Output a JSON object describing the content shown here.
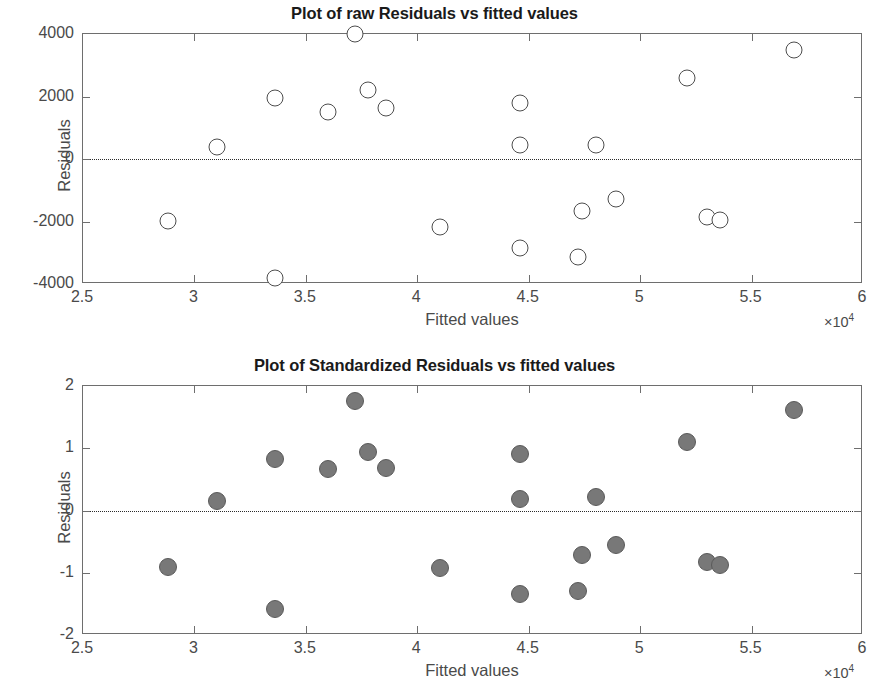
{
  "figure": {
    "axis_x_label": "Fitted values",
    "axis_y_label": "Residuals",
    "x_exponent_label": "×10",
    "x_exponent_sup": "4"
  },
  "chart_data": [
    {
      "type": "scatter",
      "id": "raw-residuals",
      "title": "Plot of raw Residuals vs fitted values",
      "xlabel": "Fitted values",
      "ylabel": "Residuals",
      "x_exponent": "x10^4",
      "xlim": [
        2.5,
        6.0
      ],
      "ylim": [
        -4000,
        4000
      ],
      "xticks": [
        2.5,
        3,
        3.5,
        4,
        4.5,
        5,
        5.5,
        6
      ],
      "xticklabels": [
        "2.5",
        "3",
        "3.5",
        "4",
        "4.5",
        "5",
        "5.5",
        "6"
      ],
      "yticks": [
        -4000,
        -2000,
        0,
        2000,
        4000
      ],
      "yticklabels": [
        "-4000",
        "-2000",
        "0",
        "2000",
        "4000"
      ],
      "grid": false,
      "legend": null,
      "reference_line": {
        "y": 0,
        "style": "dotted",
        "color": "#2b2b2b"
      },
      "marker_style": "open-circle",
      "marker_facecolor": "#ffffff",
      "marker_edgecolor": "#4d4d4d",
      "points": [
        {
          "x": 2.88,
          "y": -1980
        },
        {
          "x": 3.1,
          "y": 370
        },
        {
          "x": 3.36,
          "y": 1940
        },
        {
          "x": 3.36,
          "y": -3800
        },
        {
          "x": 3.6,
          "y": 1520
        },
        {
          "x": 3.72,
          "y": 4000
        },
        {
          "x": 3.78,
          "y": 2200
        },
        {
          "x": 3.86,
          "y": 1640
        },
        {
          "x": 4.1,
          "y": -2180
        },
        {
          "x": 4.46,
          "y": 1790
        },
        {
          "x": 4.46,
          "y": 450
        },
        {
          "x": 4.46,
          "y": -2850
        },
        {
          "x": 4.74,
          "y": -1660
        },
        {
          "x": 4.8,
          "y": 450
        },
        {
          "x": 4.72,
          "y": -3120
        },
        {
          "x": 4.89,
          "y": -1280
        },
        {
          "x": 5.21,
          "y": 2580
        },
        {
          "x": 5.3,
          "y": -1840
        },
        {
          "x": 5.36,
          "y": -1960
        },
        {
          "x": 5.69,
          "y": 3480
        }
      ]
    },
    {
      "type": "scatter",
      "id": "standardized-residuals",
      "title": "Plot of Standardized Residuals vs fitted values",
      "xlabel": "Fitted values",
      "ylabel": "Residuals",
      "x_exponent": "x10^4",
      "xlim": [
        2.5,
        6.0
      ],
      "ylim": [
        -2,
        2
      ],
      "xticks": [
        2.5,
        3,
        3.5,
        4,
        4.5,
        5,
        5.5,
        6
      ],
      "xticklabels": [
        "2.5",
        "3",
        "3.5",
        "4",
        "4.5",
        "5",
        "5.5",
        "6"
      ],
      "yticks": [
        -2,
        -1,
        0,
        1,
        2
      ],
      "yticklabels": [
        "-2",
        "-1",
        "0",
        "1",
        "2"
      ],
      "grid": false,
      "legend": null,
      "reference_line": {
        "y": 0,
        "style": "dotted",
        "color": "#2b2b2b"
      },
      "marker_style": "filled-circle",
      "marker_facecolor": "#787878",
      "marker_edgecolor": "#5a5a5a",
      "points": [
        {
          "x": 2.88,
          "y": -0.91
        },
        {
          "x": 3.1,
          "y": 0.16
        },
        {
          "x": 3.36,
          "y": 0.82
        },
        {
          "x": 3.36,
          "y": -1.59
        },
        {
          "x": 3.6,
          "y": 0.67
        },
        {
          "x": 3.72,
          "y": 1.76
        },
        {
          "x": 3.78,
          "y": 0.94
        },
        {
          "x": 3.86,
          "y": 0.69
        },
        {
          "x": 4.1,
          "y": -0.93
        },
        {
          "x": 4.46,
          "y": 0.9
        },
        {
          "x": 4.46,
          "y": 0.19
        },
        {
          "x": 4.46,
          "y": -1.34
        },
        {
          "x": 4.74,
          "y": -0.72
        },
        {
          "x": 4.8,
          "y": 0.21
        },
        {
          "x": 4.72,
          "y": -1.29
        },
        {
          "x": 4.89,
          "y": -0.56
        },
        {
          "x": 5.21,
          "y": 1.1
        },
        {
          "x": 5.3,
          "y": -0.83
        },
        {
          "x": 5.36,
          "y": -0.87
        },
        {
          "x": 5.69,
          "y": 1.61
        }
      ]
    }
  ]
}
